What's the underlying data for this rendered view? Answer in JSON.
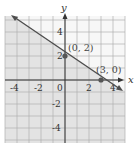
{
  "chart_data": {
    "type": "line",
    "title": "",
    "xlabel": "x",
    "ylabel": "y",
    "xlim": [
      -5,
      5
    ],
    "ylim": [
      -5.25,
      5.3
    ],
    "grid": true,
    "x_ticks": [
      "-4",
      "-2",
      "0",
      "2",
      "4"
    ],
    "y_ticks": [
      "4",
      "2",
      "-2",
      "-4"
    ],
    "line": {
      "equation": "2x + 3y = 6",
      "slope": -0.6667,
      "intercept": 2,
      "style": "solid",
      "from": [
        -4.3,
        4.87
      ],
      "to": [
        4.5,
        -1
      ]
    },
    "shaded_region": "below the line",
    "points": [
      {
        "label": "(0, 2)",
        "x": 0,
        "y": 2
      },
      {
        "label": "(3, 0)",
        "x": 3,
        "y": 0
      }
    ],
    "colors": {
      "shade": "#e6e6e6",
      "grid": "#b3b3b3",
      "line": "#4d4d4d",
      "point": "#555555",
      "axis": "#333333"
    }
  }
}
